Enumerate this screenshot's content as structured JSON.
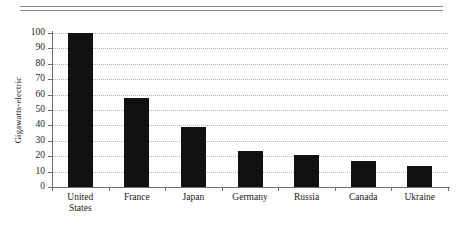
{
  "figure": {
    "background": "#ffffff",
    "bar_color": "#111111",
    "grid_color": "#b4b4b4",
    "axis_color": "#6e6e6e",
    "rule_color": "#8c8c8c"
  },
  "chart_data": {
    "type": "bar",
    "title": "",
    "subtitle": "",
    "xlabel": "",
    "ylabel": "Gigawatts-electric",
    "categories": [
      "United\nStates",
      "France",
      "Japan",
      "Germany",
      "Russia",
      "Canada",
      "Ukraine"
    ],
    "values": [
      100,
      58,
      39,
      23.5,
      20.5,
      17,
      13.5
    ],
    "ylim": [
      0,
      100
    ],
    "yticks": [
      0,
      10,
      20,
      30,
      40,
      50,
      60,
      70,
      80,
      90,
      100
    ],
    "ytick_labels": [
      "0",
      "10",
      "20",
      "30",
      "40",
      "50",
      "60",
      "70",
      "80",
      "90",
      "100"
    ],
    "grid": "horizontal-dotted",
    "legend": "none",
    "annotations": []
  }
}
